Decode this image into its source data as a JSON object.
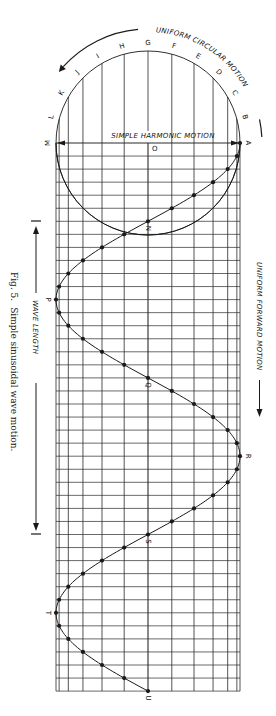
{
  "figure": {
    "caption_fig": "Fig. 5.",
    "caption_text": "Simple sinusoidal wave motion.",
    "circle_title": "UNIFORM CIRCULAR MOTION",
    "diameter_label": "SIMPLE HARMONIC MOTION",
    "forward_label": "UNIFORM FORWARD MOTION",
    "wavelength_label": "WAVE LENGTH",
    "center_label": "O",
    "circle_point_labels": [
      "A",
      "B",
      "C",
      "D",
      "E",
      "F",
      "G",
      "H",
      "I",
      "J",
      "K",
      "L",
      "M"
    ],
    "wave_point_labels": [
      {
        "label": "N",
        "step": 6
      },
      {
        "label": "P",
        "step": 12
      },
      {
        "label": "Q",
        "step": 18
      },
      {
        "label": "R",
        "step": 24
      },
      {
        "label": "S",
        "step": 30
      },
      {
        "label": "T",
        "step": 36
      },
      {
        "label": "U",
        "step": 42
      }
    ]
  },
  "geometry": {
    "center_x": 148,
    "center_y": 143,
    "radius": 92,
    "step_px": 13.05,
    "steps": 42,
    "angle_step_deg": 15
  },
  "colors": {
    "line": "#1a1a1a",
    "grid": "#2a2a2a",
    "background": "#ffffff"
  }
}
